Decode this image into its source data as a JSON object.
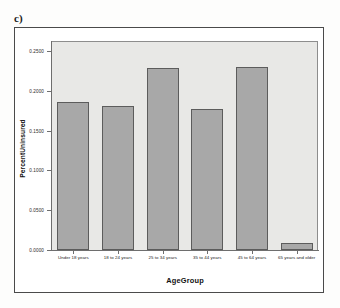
{
  "figure": {
    "marker": "c)"
  },
  "chart_data": {
    "type": "bar",
    "title": "",
    "subtitle": "",
    "xlabel": "AgeGroup",
    "ylabel": "PercentUninsured",
    "categories": [
      "Under 18 years",
      "18 to 24 years",
      "25 to 34 years",
      "35 to 44 years",
      "45 to 64 years",
      "65 years and older"
    ],
    "values": [
      0.186,
      0.181,
      0.229,
      0.1775,
      0.23,
      0.009
    ],
    "ylim": [
      0.0,
      0.2625
    ],
    "yticks": [
      0.0,
      0.05,
      0.1,
      0.15,
      0.2,
      0.25
    ],
    "ytick_labels": [
      "0.0000",
      "0.0500",
      "0.1000",
      "0.1500",
      "0.2000",
      "0.2500"
    ],
    "grid": false,
    "legend": "none",
    "bar_fill": "#a8a8a8",
    "bar_edge": "#5c5c5c",
    "panel_background": "#e8e8e6",
    "axis_color": "#6e6e6e"
  }
}
